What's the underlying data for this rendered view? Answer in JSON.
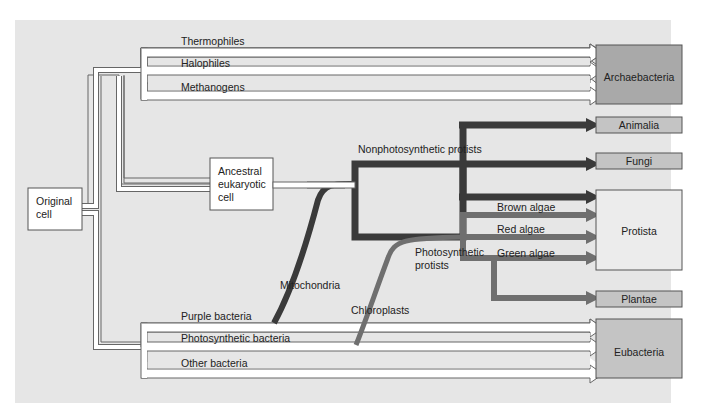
{
  "colors": {
    "panel_bg": "#e6e6e6",
    "white_arrow_fill": "#ffffff",
    "white_arrow_stroke": "#666666",
    "dark_arrow": "#3a3a3a",
    "photo_arrow": "#6f6f6f",
    "archaebacteria_box": "#a9a9a9",
    "eubacteria_box": "#c4c4c4",
    "animalia_box": "#c4c4c4",
    "fungi_box": "#c4c4c4",
    "plantae_box": "#c4c4c4",
    "protista_box": "#ececec"
  },
  "nodes": {
    "original_cell": "Original cell",
    "original_cell_lines": [
      "Original",
      "cell"
    ],
    "ancestral_cell": "Ancestral eukaryotic cell",
    "ancestral_cell_lines": [
      "Ancestral",
      "eukaryotic",
      "cell"
    ]
  },
  "kingdoms": {
    "archaebacteria": "Archaebacteria",
    "animalia": "Animalia",
    "fungi": "Fungi",
    "protista": "Protista",
    "plantae": "Plantae",
    "eubacteria": "Eubacteria"
  },
  "lineages": {
    "thermophiles": "Thermophiles",
    "halophiles": "Halophiles",
    "methanogens": "Methanogens",
    "nonphotosynthetic_protists": "Nonphotosynthetic protists",
    "photosynthetic_protists_lines": [
      "Photosynthetic",
      "protists"
    ],
    "brown_algae": "Brown algae",
    "red_algae": "Red algae",
    "green_algae": "Green algae",
    "purple_bacteria": "Purple bacteria",
    "photosynthetic_bacteria": "Photosynthetic bacteria",
    "other_bacteria": "Other bacteria"
  },
  "endosymbionts": {
    "mitochondria": "Mitochondria",
    "chloroplasts": "Chloroplasts"
  }
}
